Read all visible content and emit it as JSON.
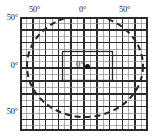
{
  "figure": {
    "type": "sky-coordinate-grid",
    "background_color": "#ffffff",
    "line_color": "#2b2b2b",
    "grid_minor_color": "#8a8a8a"
  },
  "axes": {
    "top": {
      "labels": [
        "50°",
        "0°",
        "50°"
      ]
    },
    "left": {
      "labels": [
        "50°",
        "0°",
        "50°"
      ]
    }
  },
  "center": {
    "label": "0°",
    "marker": "filled-dot"
  },
  "chart_data": {
    "type": "scatter",
    "title": "",
    "xlabel": "",
    "ylabel": "",
    "xlim": [
      -64,
      64
    ],
    "ylim": [
      -57,
      57
    ],
    "grid": true,
    "legend": "none",
    "x_tick_labels": [
      "50°",
      "0°",
      "50°"
    ],
    "x_tick_positions": [
      -45,
      0,
      45
    ],
    "y_tick_labels": [
      "50°",
      "0°",
      "50°"
    ],
    "y_tick_positions": [
      45,
      0,
      -45
    ],
    "annotations": [
      {
        "name": "center-origin",
        "text": "0°",
        "x": 0,
        "y": 0,
        "marker": "filled-dot"
      }
    ],
    "series": [
      {
        "name": "field-of-view-circle",
        "type": "circle",
        "style": "dashed",
        "center": [
          0,
          0
        ],
        "radius_x": 58,
        "radius_y": 51
      },
      {
        "name": "inner-region-box",
        "type": "rectangle",
        "style": "solid",
        "x_range": [
          -21,
          29
        ],
        "y_range": [
          -13,
          16
        ]
      }
    ],
    "grid_spec": {
      "minor_step_px": 6.4,
      "major_every_n_minor": 2,
      "columns": 20,
      "rows": 18
    }
  }
}
